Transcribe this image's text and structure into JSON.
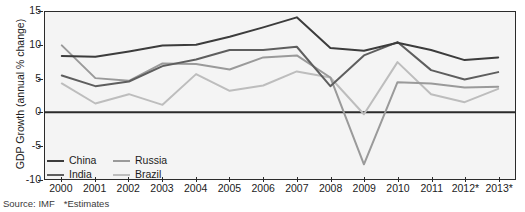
{
  "chart_data": {
    "type": "line",
    "title": "",
    "xlabel": "",
    "ylabel": "GDP Growth (annual % change)",
    "categories": [
      "2000",
      "2001",
      "2002",
      "2003",
      "2004",
      "2005",
      "2006",
      "2007",
      "2008",
      "2009",
      "2010",
      "2011",
      "2012*",
      "2013*"
    ],
    "ylim": [
      -10,
      15
    ],
    "yticks": [
      15,
      10,
      5,
      0,
      -5,
      -10
    ],
    "grid": false,
    "legend_position": "bottom-left",
    "zero_line": true,
    "series": [
      {
        "name": "China",
        "color": "#3c3c3c",
        "values": [
          8.4,
          8.3,
          9.1,
          10.0,
          10.1,
          11.3,
          12.7,
          14.2,
          9.6,
          9.2,
          10.4,
          9.3,
          7.8,
          8.2
        ]
      },
      {
        "name": "India",
        "color": "#5e5e5e",
        "values": [
          5.5,
          3.9,
          4.6,
          6.9,
          7.9,
          9.3,
          9.3,
          9.8,
          3.9,
          8.5,
          10.5,
          6.3,
          4.9,
          6.0
        ]
      },
      {
        "name": "Russia",
        "color": "#9a9a9a",
        "values": [
          10.0,
          5.1,
          4.7,
          7.3,
          7.2,
          6.4,
          8.2,
          8.5,
          5.2,
          -7.8,
          4.5,
          4.3,
          3.7,
          3.8
        ]
      },
      {
        "name": "Brazil",
        "color": "#bdbdbd",
        "values": [
          4.3,
          1.3,
          2.7,
          1.1,
          5.7,
          3.2,
          4.0,
          6.1,
          5.2,
          -0.3,
          7.5,
          2.7,
          1.5,
          3.5
        ]
      }
    ]
  },
  "legend": {
    "items": [
      {
        "label": "China"
      },
      {
        "label": "India"
      },
      {
        "label": "Russia"
      },
      {
        "label": "Brazil"
      }
    ]
  },
  "footer": {
    "source": "Source: IMF",
    "estimates_note": "*Estimates"
  }
}
